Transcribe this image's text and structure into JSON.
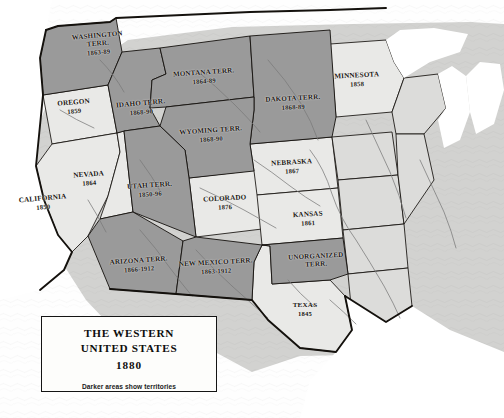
{
  "map": {
    "title_lines": [
      "THE WESTERN",
      "UNITED STATES"
    ],
    "title_line_1": "THE WESTERN",
    "title_line_2": "UNITED STATES",
    "year": "1880",
    "note": "Darker areas show territories",
    "colors": {
      "territory_fill": "#9a9a9a",
      "state_fill": "#e9e9e7",
      "eastern_fill": "#cfcfcd",
      "water": "#ffffff",
      "border": "#14110d",
      "river": "#6f6f6f",
      "background": "#fefefe"
    }
  },
  "regions": [
    {
      "name": "WASHINGTON",
      "name2": "TERR.",
      "year": "1863-89",
      "type": "territory",
      "x": 98,
      "y": 44
    },
    {
      "name": "OREGON",
      "year": "1859",
      "type": "state",
      "x": 74,
      "y": 107
    },
    {
      "name": "IDAHO TERR.",
      "year": "1868-90",
      "type": "territory",
      "x": 141,
      "y": 108
    },
    {
      "name": "MONTANA TERR.",
      "year": "1864-89",
      "type": "territory",
      "x": 204,
      "y": 77
    },
    {
      "name": "DAKOTA TERR.",
      "year": "1868-89",
      "type": "territory",
      "x": 293,
      "y": 103
    },
    {
      "name": "MINNESOTA",
      "year": "1858",
      "type": "state",
      "x": 357,
      "y": 80
    },
    {
      "name": "WYOMING TERR.",
      "year": "1868-90",
      "type": "territory",
      "x": 211,
      "y": 135
    },
    {
      "name": "NEBRASKA",
      "year": "1867",
      "type": "state",
      "x": 292,
      "y": 167
    },
    {
      "name": "NEVADA",
      "year": "1864",
      "type": "state",
      "x": 89,
      "y": 179
    },
    {
      "name": "UTAH TERR.",
      "year": "1850-96",
      "type": "territory",
      "x": 150,
      "y": 190
    },
    {
      "name": "COLORADO",
      "year": "1876",
      "type": "state",
      "x": 225,
      "y": 203
    },
    {
      "name": "CALIFORNIA",
      "year": "1850",
      "type": "state",
      "x": 43,
      "y": 203
    },
    {
      "name": "KANSAS",
      "year": "1861",
      "type": "state",
      "x": 308,
      "y": 219
    },
    {
      "name": "ARIZONA TERR.",
      "year": "1866-1912",
      "type": "territory",
      "x": 139,
      "y": 265
    },
    {
      "name": "NEW MEXICO TERR.",
      "year": "1863-1912",
      "type": "territory",
      "x": 216,
      "y": 267
    },
    {
      "name": "UNORGANIZED",
      "name2": "TERR.",
      "year": "",
      "type": "territory",
      "x": 316,
      "y": 261
    },
    {
      "name": "TEXAS",
      "year": "1845",
      "type": "state",
      "x": 305,
      "y": 310
    }
  ]
}
